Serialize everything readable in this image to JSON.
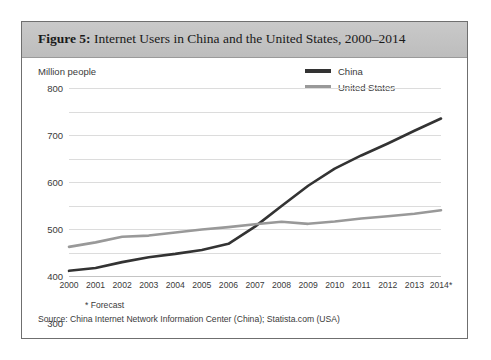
{
  "figure": {
    "label": "Figure 5:",
    "title": " Internet Users in China and the United States, 2000–2014",
    "footnote": "* Forecast",
    "source": "Source: China Internet Network Information Center (China); Statista.com (USA)",
    "border_color": "#6f6f6f",
    "band_color": "#c3c3c3"
  },
  "chart_data": {
    "type": "line",
    "title": "Internet Users in China and the United States, 2000–2014",
    "xlabel": "",
    "ylabel": "Million people",
    "unit_label": "Million people",
    "categories": [
      "2000",
      "2001",
      "2002",
      "2003",
      "2004",
      "2005",
      "2006",
      "2007",
      "2008",
      "2009",
      "2010",
      "2011",
      "2012",
      "2013",
      "2014*"
    ],
    "x": [
      2000,
      2001,
      2002,
      2003,
      2004,
      2005,
      2006,
      2007,
      2008,
      2009,
      2010,
      2011,
      2012,
      2013,
      2014
    ],
    "ylim": [
      0,
      800
    ],
    "ytick_values": [
      0,
      100,
      200,
      300,
      400,
      500,
      600,
      700,
      800
    ],
    "ytick_labels": [
      "0",
      "100",
      "200",
      "300",
      "400",
      "500",
      "600",
      "700",
      "800"
    ],
    "grid": true,
    "legend_position": "top-right",
    "series": [
      {
        "name": "China",
        "color": "#333333",
        "values": [
          22,
          34,
          59,
          80,
          94,
          111,
          137,
          210,
          298,
          384,
          457,
          513,
          564,
          618,
          670
        ]
      },
      {
        "name": "United States",
        "color": "#999999",
        "values": [
          124,
          143,
          167,
          172,
          185,
          198,
          208,
          220,
          231,
          222,
          232,
          245,
          254,
          265,
          280
        ]
      }
    ],
    "annotations": [
      "* Forecast"
    ]
  }
}
